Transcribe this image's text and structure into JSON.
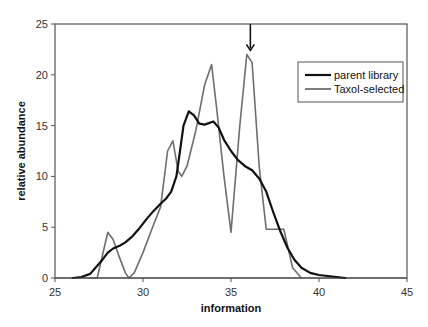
{
  "chart_data": {
    "type": "line",
    "title": "",
    "xlabel": "information",
    "ylabel": "relative abundance",
    "xlim": [
      25,
      45
    ],
    "ylim": [
      0,
      25
    ],
    "xticks": [
      25,
      30,
      35,
      40,
      45
    ],
    "yticks": [
      0,
      5,
      10,
      15,
      20,
      25
    ],
    "grid": false,
    "legend_position": "upper right",
    "annotation": {
      "type": "arrow",
      "x": 36.1,
      "from_y": 24.8,
      "to_y": 22.5,
      "label": ""
    },
    "series": [
      {
        "name": "parent library",
        "color": "#111111",
        "x": [
          26.0,
          26.5,
          27.0,
          27.3,
          27.7,
          28.0,
          28.3,
          28.7,
          29.0,
          29.4,
          29.8,
          30.2,
          30.6,
          31.0,
          31.3,
          31.6,
          31.9,
          32.1,
          32.3,
          32.6,
          32.9,
          33.2,
          33.5,
          34.0,
          34.3,
          34.6,
          35.0,
          35.4,
          35.8,
          36.2,
          36.6,
          37.0,
          37.4,
          37.8,
          38.2,
          38.6,
          39.0,
          39.5,
          40.0,
          40.5,
          41.0,
          41.5
        ],
        "y": [
          0.0,
          0.1,
          0.4,
          1.0,
          1.8,
          2.5,
          2.9,
          3.2,
          3.5,
          4.1,
          4.9,
          5.8,
          6.6,
          7.3,
          7.8,
          8.5,
          10.0,
          12.5,
          15.0,
          16.4,
          16.0,
          15.2,
          15.1,
          15.4,
          14.8,
          13.6,
          12.5,
          11.6,
          11.0,
          10.6,
          9.8,
          8.5,
          6.5,
          4.6,
          3.0,
          1.8,
          1.0,
          0.5,
          0.3,
          0.2,
          0.1,
          0.0
        ]
      },
      {
        "name": "Taxol-selected",
        "color": "#6e6e6e",
        "x": [
          27.0,
          27.4,
          28.0,
          28.3,
          28.6,
          29.0,
          29.2,
          29.5,
          30.0,
          30.5,
          31.0,
          31.4,
          31.7,
          32.0,
          32.2,
          32.5,
          33.0,
          33.5,
          33.9,
          34.2,
          34.6,
          35.0,
          35.5,
          35.9,
          36.2,
          36.6,
          37.0,
          37.5,
          38.0,
          38.5,
          39.0
        ],
        "y": [
          0.0,
          0.0,
          4.5,
          3.8,
          2.3,
          0.5,
          0.0,
          0.5,
          2.5,
          4.8,
          7.0,
          12.5,
          13.5,
          10.5,
          10.0,
          11.0,
          14.5,
          19.0,
          21.0,
          16.5,
          10.0,
          4.5,
          15.0,
          22.0,
          21.2,
          11.0,
          4.8,
          4.8,
          4.8,
          1.0,
          0.0
        ]
      }
    ]
  },
  "legend": {
    "items": [
      {
        "label": "parent library",
        "color": "#111111"
      },
      {
        "label": "Taxol-selected",
        "color": "#6e6e6e"
      }
    ]
  },
  "axes": {
    "x_title": "information",
    "y_title": "relative abundance",
    "x_tick_labels": [
      "25",
      "30",
      "35",
      "40",
      "45"
    ],
    "y_tick_labels": [
      "0",
      "5",
      "10",
      "15",
      "20",
      "25"
    ]
  }
}
